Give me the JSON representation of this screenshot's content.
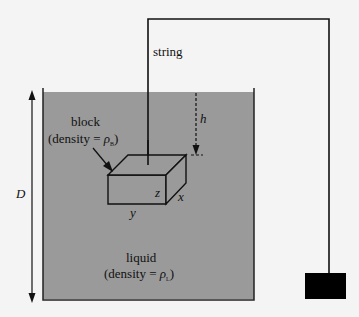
{
  "diagram": {
    "labels": {
      "string": "string",
      "block_line1": "block",
      "block_line2_prefix": "(density = ",
      "block_rho": "ρ",
      "block_sub": "B",
      "block_suffix": ")",
      "liquid_line1": "liquid",
      "liquid_line2_prefix": "(density = ",
      "liquid_rho": "ρ",
      "liquid_sub": "L",
      "liquid_suffix": ")",
      "depth_total": "D",
      "depth_block": "h",
      "dim_x": "x",
      "dim_y": "y",
      "dim_z": "z"
    },
    "colors": {
      "background": "#f4f4f4",
      "liquid": "#9a9a9a",
      "line": "#111111",
      "weight": "#000000"
    }
  }
}
